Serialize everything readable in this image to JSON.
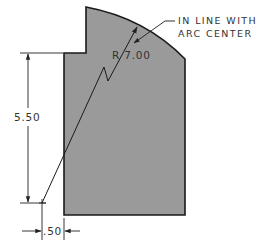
{
  "drawing": {
    "part_fill": "#9a9a9a",
    "outline_color": "#1a1a1a",
    "dimension_color": "#222222",
    "radius_label": "R 7.00",
    "height_label": "5.50",
    "offset_label": ".50",
    "note_line1": "IN LINE WITH",
    "note_line2": "ARC CENTER"
  }
}
